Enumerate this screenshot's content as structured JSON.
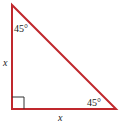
{
  "diagram": {
    "type": "right-isosceles-triangle",
    "stroke_color": "#c0282d",
    "label_color": "#222222",
    "vertices": {
      "top": [
        12,
        5
      ],
      "right_angle": [
        12,
        109
      ],
      "bottom_right": [
        116,
        109
      ]
    },
    "labels": {
      "top_angle": "45°",
      "bottom_angle": "45°",
      "left_side": "x",
      "bottom_side": "x"
    },
    "right_angle_marker": true
  }
}
